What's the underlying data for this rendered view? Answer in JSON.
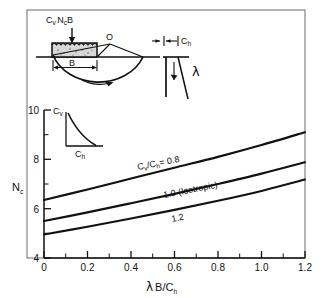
{
  "figure": {
    "frame": {
      "x": 27,
      "y": 10,
      "w": 278,
      "h": 248
    }
  },
  "chart_data": {
    "type": "line",
    "title": "",
    "xlabel": "λ B/C_h",
    "ylabel": "N_c",
    "xlim": [
      0,
      1.2
    ],
    "ylim": [
      4,
      10
    ],
    "xticks": [
      "0",
      "0.2",
      "0.4",
      "0.6",
      "0.8",
      "1.0",
      "1.2"
    ],
    "xtick_values": [
      0,
      0.2,
      0.4,
      0.6,
      0.8,
      1.0,
      1.2
    ],
    "yticks": [
      "4",
      "6",
      "8",
      "10"
    ],
    "ytick_values": [
      4,
      6,
      8,
      10
    ],
    "yminor_values": [
      5,
      7,
      9
    ],
    "grid": false,
    "legend": "inline-labels",
    "x": [
      0,
      0.2,
      0.4,
      0.6,
      0.8,
      1.0,
      1.2
    ],
    "series": [
      {
        "name": "C_v/C_h = 0.8",
        "label": "C",
        "values": [
          6.35,
          6.78,
          7.22,
          7.66,
          8.1,
          8.58,
          9.1
        ]
      },
      {
        "name": "1.0 (Isotropic)",
        "label": "1.0 (Isotropic)",
        "values": [
          5.5,
          5.85,
          6.22,
          6.6,
          7.0,
          7.42,
          7.88
        ]
      },
      {
        "name": "1.2",
        "label": "1.2",
        "values": [
          4.95,
          5.27,
          5.6,
          5.95,
          6.32,
          6.72,
          7.18
        ]
      }
    ],
    "annotations": [
      {
        "id": "lbl-08",
        "text_main": "C",
        "text_sub1": "v",
        "text_mid": "/C",
        "text_sub2": "h",
        "text_tail": "= 0.8"
      },
      {
        "id": "lbl-10",
        "text": "1.0 (Isotropic)"
      },
      {
        "id": "lbl-12",
        "text": "1.2"
      }
    ]
  },
  "axes": {
    "y_label_main": "N",
    "y_label_sub": "c",
    "x_label_lambda": "λ",
    "x_label_b": "B/C",
    "x_label_sub": "h"
  },
  "inset_footing": {
    "load_label_main": "C",
    "load_label_sub1": "v",
    "load_label_n": "N",
    "load_label_sub2": "c",
    "load_label_b": "B",
    "point_o": "O",
    "width_label": "B",
    "arrow_name": "rotation-arrow"
  },
  "inset_lambda": {
    "ch_label_main": "C",
    "ch_label_sub": "h",
    "lambda_symbol": "λ"
  },
  "inset_profile": {
    "cv_label_main": "C",
    "cv_label_sub": "v",
    "ch_label_main": "C",
    "ch_label_sub": "h"
  },
  "colors": {
    "ink": "#111111",
    "frame": "#555555",
    "hatch": "#cfcfcf",
    "background": "#ffffff"
  }
}
